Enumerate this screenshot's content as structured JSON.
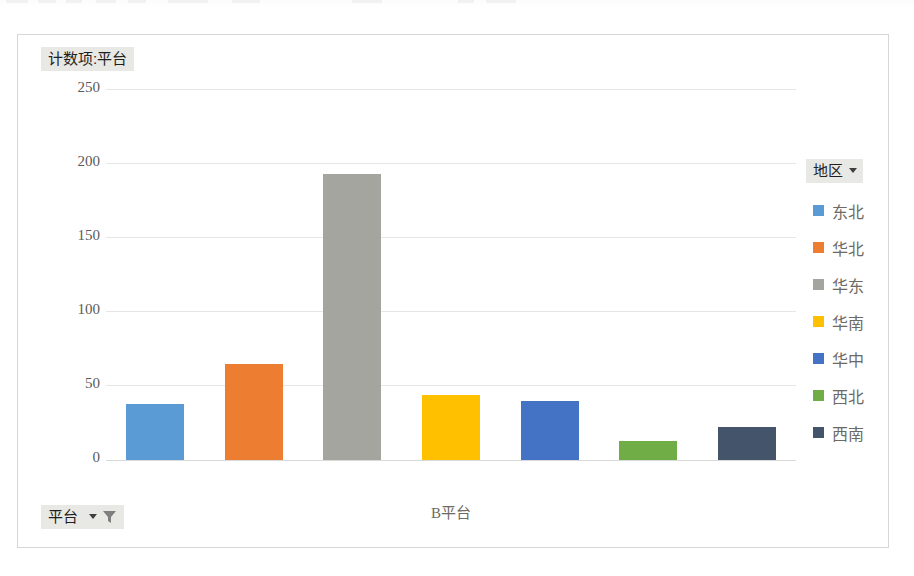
{
  "window": {
    "background": "#ffffff",
    "top_strip_visible": true
  },
  "chart": {
    "frame_border_color": "#d6d6d6",
    "value_field_button": {
      "label": "计数项:平台",
      "name": "value-field-button",
      "has_caret": false,
      "has_filter_icon": false
    },
    "axis_field_button": {
      "label": "平台",
      "name": "axis-field-button",
      "has_caret": true,
      "has_filter_icon": true,
      "filter_icon": "funnel-icon",
      "caret_icon": "chevron-down-icon"
    },
    "legend": {
      "title": "地区",
      "caret_icon": "chevron-down-icon",
      "position": "right",
      "items": [
        {
          "label": "东北",
          "color": "#5B9BD5"
        },
        {
          "label": "华北",
          "color": "#ED7D31"
        },
        {
          "label": "华东",
          "color": "#A5A5A0"
        },
        {
          "label": "华南",
          "color": "#FFC000"
        },
        {
          "label": "华中",
          "color": "#4472C4"
        },
        {
          "label": "西北",
          "color": "#70AD47"
        },
        {
          "label": "西南",
          "color": "#44546A"
        }
      ]
    }
  },
  "chart_data": {
    "type": "bar",
    "title": "计数项:平台",
    "xlabel": "平台",
    "ylabel": "计数项:平台",
    "categories": [
      "B平台"
    ],
    "x": [
      "B平台"
    ],
    "legend_title": "地区",
    "legend_position": "right",
    "grid": true,
    "ylim": [
      0,
      250
    ],
    "yticks": [
      0,
      50,
      100,
      150,
      200,
      250
    ],
    "ytick_labels": [
      "0",
      "50",
      "100",
      "150",
      "200",
      "250"
    ],
    "series": [
      {
        "name": "东北",
        "color": "#5B9BD5",
        "values": [
          38
        ]
      },
      {
        "name": "华北",
        "color": "#ED7D31",
        "values": [
          65
        ]
      },
      {
        "name": "华东",
        "color": "#A5A5A0",
        "values": [
          193
        ]
      },
      {
        "name": "华南",
        "color": "#FFC000",
        "values": [
          44
        ]
      },
      {
        "name": "华中",
        "color": "#4472C4",
        "values": [
          40
        ]
      },
      {
        "name": "西北",
        "color": "#70AD47",
        "values": [
          13
        ]
      },
      {
        "name": "西南",
        "color": "#44546A",
        "values": [
          22
        ]
      }
    ]
  }
}
